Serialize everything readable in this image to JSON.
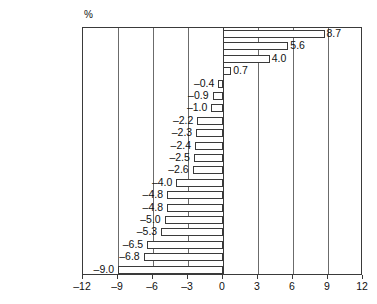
{
  "axis_unit_label": "%",
  "chart_data": {
    "type": "bar",
    "orientation": "horizontal",
    "title": "",
    "xlabel": "",
    "ylabel": "",
    "unit": "%",
    "xlim": [
      -12,
      12
    ],
    "xticks": [
      -12,
      -9,
      -6,
      -3,
      0,
      3,
      6,
      9,
      12
    ],
    "xtick_labels": [
      "–12",
      "–9",
      "–6",
      "–3",
      "0",
      "3",
      "6",
      "9",
      "12"
    ],
    "grid": true,
    "legend": null,
    "categories": [
      "China",
      "India",
      "Indonesia",
      "Australia",
      "Brazil",
      "Saudi Arabia",
      "Korea",
      "South Africa",
      "France",
      "United States",
      "Argentina",
      "Canada",
      "European Union",
      "United Kingdom",
      "Italy",
      "Germany",
      "Japan",
      "Turkey",
      "Mexico",
      "Russia"
    ],
    "values": [
      8.7,
      5.6,
      4.0,
      0.7,
      -0.4,
      -0.9,
      -1.0,
      -2.2,
      -2.3,
      -2.4,
      -2.5,
      -2.6,
      -4.0,
      -4.8,
      -4.8,
      -5.0,
      -5.3,
      -6.5,
      -6.8,
      -9.0
    ],
    "value_labels": [
      "8.7",
      "5.6",
      "4.0",
      "0.7",
      "–0.4",
      "–0.9",
      "–1.0",
      "–2.2",
      "–2.3",
      "–2.4",
      "–2.5",
      "–2.6",
      "–4.0",
      "–4.8",
      "–4.8",
      "–5.0",
      "–5.3",
      "–6.5",
      "–6.8",
      "–9.0"
    ],
    "bar_fill_color": "#ffffff",
    "bar_edge_color": "#3a3a3a"
  }
}
